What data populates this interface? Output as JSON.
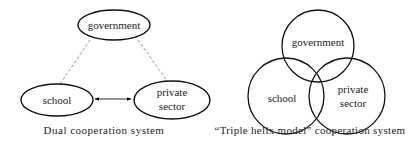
{
  "left_diagram": {
    "caption": "Dual cooperation system",
    "nodes": {
      "government": "government",
      "school": "school",
      "private_line1": "private",
      "private_line2": "sector"
    },
    "links": [
      {
        "from": "government",
        "to": "school",
        "style": "dashed"
      },
      {
        "from": "government",
        "to": "private sector",
        "style": "dashed"
      },
      {
        "from": "school",
        "to": "private sector",
        "style": "solid-double-arrow"
      }
    ]
  },
  "right_diagram": {
    "caption": "“Triple helix model” cooperation system",
    "circles": {
      "government": "government",
      "school": "school",
      "private_line1": "private",
      "private_line2": "sector"
    }
  },
  "colors": {
    "stroke": "#111111",
    "dashed": "#888888",
    "text": "#222222"
  }
}
